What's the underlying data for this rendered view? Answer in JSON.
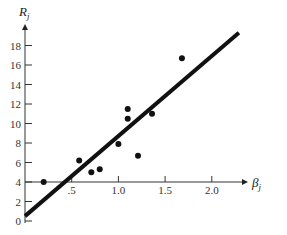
{
  "chart_data": {
    "type": "scatter",
    "title": "",
    "xlabel": "β",
    "xlabel_sub": "j",
    "ylabel": "R",
    "ylabel_sub": "j",
    "xlim": [
      0,
      2.4
    ],
    "ylim": [
      0,
      20
    ],
    "x_axis_crosses_y_at": 4,
    "x_ticks": [
      0.5,
      1.0,
      1.5,
      2.0
    ],
    "x_tick_labels": [
      ".5",
      "1.0",
      "1.5",
      "2.0"
    ],
    "y_ticks": [
      0,
      2,
      4,
      6,
      8,
      10,
      12,
      14,
      16,
      18
    ],
    "y_tick_labels": [
      "0",
      "2",
      "4",
      "6",
      "8",
      "10",
      "12",
      "14",
      "16",
      "18"
    ],
    "grid": false,
    "legend": "none",
    "points": [
      {
        "x": 0.2,
        "y": 4.0
      },
      {
        "x": 0.58,
        "y": 6.2
      },
      {
        "x": 0.71,
        "y": 5.0
      },
      {
        "x": 0.8,
        "y": 5.3
      },
      {
        "x": 1.0,
        "y": 7.9
      },
      {
        "x": 1.1,
        "y": 11.5
      },
      {
        "x": 1.1,
        "y": 10.5
      },
      {
        "x": 1.21,
        "y": 6.7
      },
      {
        "x": 1.36,
        "y": 11.0
      },
      {
        "x": 1.68,
        "y": 16.7
      }
    ],
    "fit_line": {
      "x0": 0,
      "y0": 0.5,
      "x1": 2.29,
      "y1": 19.3
    }
  }
}
